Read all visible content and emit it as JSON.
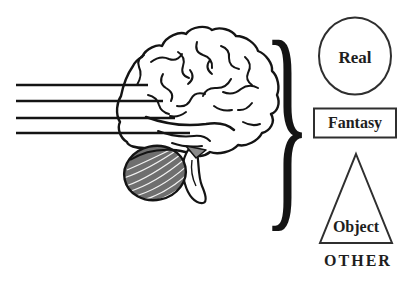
{
  "figure": {
    "background_color": "#ffffff",
    "ink_color": "#141414",
    "shape_stroke_color": "#2f2f2f",
    "cerebellum_fill": "#6f6f6f",
    "brain_icon": "human-brain-lateral-view",
    "stimulus_lines_count": 4,
    "brace_glyph": "}",
    "items": [
      {
        "shape": "circle",
        "label": "Real"
      },
      {
        "shape": "rectangle",
        "label": "Fantasy"
      },
      {
        "shape": "triangle",
        "label": "Object"
      }
    ],
    "caption": "OTHER"
  }
}
